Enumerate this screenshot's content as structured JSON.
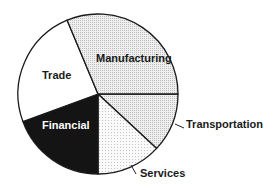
{
  "chart_data": {
    "type": "pie",
    "title": "",
    "start_angle_deg": 0,
    "direction": "clockwise",
    "slices": [
      {
        "label": "Transportation",
        "value": 11.9,
        "fill": "#e6e6e6",
        "label_color": "#1a1a1a",
        "pattern": "dots-gray"
      },
      {
        "label": "Services",
        "value": 13.1,
        "fill": "#f3f3f3",
        "label_color": "#1a1a1a",
        "pattern": "dots-light"
      },
      {
        "label": "Financial",
        "value": 19.4,
        "fill": "#141414",
        "label_color": "#ffffff",
        "pattern": "solid"
      },
      {
        "label": "Trade",
        "value": 24.3,
        "fill": "#ffffff",
        "label_color": "#1a1a1a",
        "pattern": "none"
      },
      {
        "label": "Manufacturing",
        "value": 31.3,
        "fill": "#e6e6e6",
        "label_color": "#1a1a1a",
        "pattern": "dots-gray"
      }
    ],
    "categories": [
      "Transportation",
      "Services",
      "Financial",
      "Trade",
      "Manufacturing"
    ],
    "values": [
      11.9,
      13.1,
      19.4,
      24.3,
      31.3
    ],
    "units": "percent (estimated from slice angles)",
    "legend": "none (labels placed on/next to slices)"
  },
  "labels": {
    "manufacturing": "Manufacturing",
    "trade": "Trade",
    "financial": "Financial",
    "transportation": "Transportation",
    "services": "Services"
  }
}
